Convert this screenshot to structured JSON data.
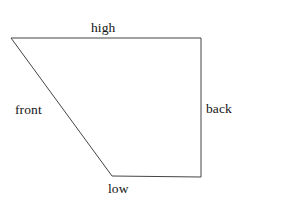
{
  "diagram": {
    "type": "line-drawing",
    "canvas": {
      "width": 283,
      "height": 206,
      "background": "#ffffff"
    },
    "stroke": {
      "color": "#444444",
      "width": 1,
      "fill": "none"
    },
    "shape": {
      "name": "quadrilateral",
      "vertices": [
        {
          "name": "top-left",
          "x": 11,
          "y": 38
        },
        {
          "name": "top-right",
          "x": 201,
          "y": 38
        },
        {
          "name": "bottom-right",
          "x": 201,
          "y": 177
        },
        {
          "name": "bottom-left",
          "x": 112,
          "y": 176
        }
      ],
      "points_attr": "11,38 201,38 201,177 112,176"
    },
    "labels": {
      "high": "high",
      "back": "back",
      "front": "front",
      "low": "low"
    }
  }
}
